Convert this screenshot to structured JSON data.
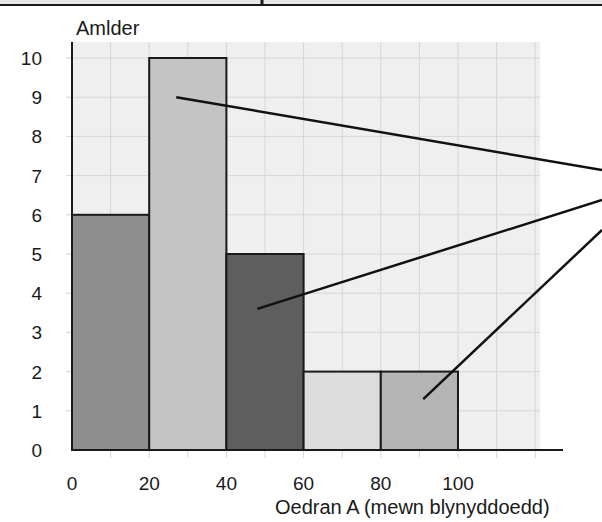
{
  "chart_data": {
    "type": "bar",
    "subtype": "histogram",
    "title": "",
    "xlabel": "Oedran A (mewn blynyddoedd)",
    "ylabel": "Amlder",
    "x_ticks": [
      "0",
      "20",
      "40",
      "60",
      "80",
      "100"
    ],
    "y_ticks": [
      "0",
      "1",
      "2",
      "3",
      "4",
      "5",
      "6",
      "7",
      "8",
      "9",
      "10"
    ],
    "xlim": [
      0,
      120
    ],
    "ylim": [
      0,
      10
    ],
    "grid": true,
    "categories": [
      "0-20",
      "20-40",
      "40-60",
      "60-80",
      "80-100"
    ],
    "bins": [
      [
        0,
        20
      ],
      [
        20,
        40
      ],
      [
        40,
        60
      ],
      [
        60,
        80
      ],
      [
        80,
        100
      ]
    ],
    "values": [
      6,
      10,
      5,
      2,
      2
    ],
    "bar_colors": [
      "#8e8e8e",
      "#c4c4c4",
      "#5e5e5e",
      "#dcdcdc",
      "#b4b4b4"
    ],
    "annotations": [
      {
        "type": "leader-line",
        "from_bin": "20-40",
        "from_point": [
          27,
          9
        ],
        "to": "right edge"
      },
      {
        "type": "leader-line",
        "from_bin": "40-60",
        "from_point": [
          48,
          3.6
        ],
        "to": "right edge"
      },
      {
        "type": "leader-line",
        "from_bin": "80-100",
        "from_point": [
          91,
          1.3
        ],
        "to": "right edge"
      }
    ]
  },
  "colors": {
    "grid_bg": "#efefef",
    "grid_line": "#d6d6d6",
    "axis": "#1a1a1a"
  }
}
